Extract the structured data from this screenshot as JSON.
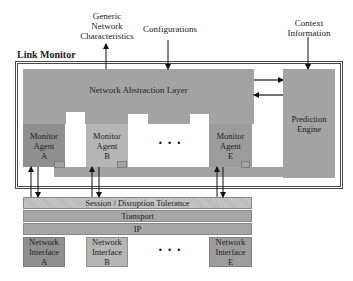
{
  "diagram": {
    "title": "Link Monitor",
    "inputs": {
      "generic_network_characteristics": [
        "Generic",
        "Network",
        "Characteristics"
      ],
      "configurations": "Configurations",
      "context_information": [
        "Context",
        "Information"
      ]
    },
    "network_abstraction_layer": "Network Abstraction Layer",
    "prediction_engine": [
      "Prediction",
      "Engine"
    ],
    "monitor_agents": [
      {
        "line1": "Monitor",
        "line2": "Agent",
        "id": "A"
      },
      {
        "line1": "Monitor",
        "line2": "Agent",
        "id": "B"
      },
      {
        "line1": "Monitor",
        "line2": "Agent",
        "id": "E"
      }
    ],
    "ellipsis": "• • •",
    "stack_layers": [
      {
        "label": "Session / Disruption Tolerance"
      },
      {
        "label": "Transport"
      },
      {
        "label": "IP"
      }
    ],
    "network_interfaces": [
      {
        "line1": "Network",
        "line2": "Interface",
        "id": "A"
      },
      {
        "line1": "Network",
        "line2": "Interface",
        "id": "B"
      },
      {
        "line1": "Network",
        "line2": "Interface",
        "id": "E"
      }
    ],
    "colors": {
      "block_gray": "#a3a3a3",
      "agent_a_dark": "#8f8f8f",
      "agent_b_light": "#b5b5b5",
      "border": "#4a4a4a",
      "arrow": "#111111"
    }
  }
}
